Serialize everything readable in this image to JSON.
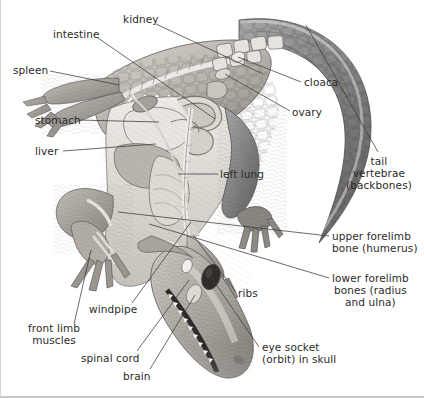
{
  "figure": {
    "background_color": "#ffffff",
    "label_color": "#2b2b2b",
    "leader_color": "#3a3a3a",
    "border_color": "#c9c9c9",
    "width": 424,
    "height": 398
  },
  "labels": [
    {
      "id": "kidney",
      "text": "kidney",
      "x": 122,
      "y": 13,
      "align": "left",
      "leader": [
        [
          155,
          24
        ],
        [
          262,
          74
        ]
      ]
    },
    {
      "id": "intestine",
      "text": "intestine",
      "x": 52,
      "y": 28,
      "align": "left",
      "leader": [
        [
          97,
          38
        ],
        [
          214,
          119
        ]
      ]
    },
    {
      "id": "spleen",
      "text": "spleen",
      "x": 12,
      "y": 64,
      "align": "left",
      "leader": [
        [
          49,
          71
        ],
        [
          118,
          85
        ]
      ]
    },
    {
      "id": "stomach",
      "text": "stomach",
      "x": 34,
      "y": 114,
      "align": "left",
      "leader": [
        [
          77,
          120
        ],
        [
          158,
          122
        ]
      ]
    },
    {
      "id": "liver",
      "text": "liver",
      "x": 34,
      "y": 145,
      "align": "left",
      "leader": [
        [
          62,
          151
        ],
        [
          155,
          144
        ]
      ]
    },
    {
      "id": "cloaca",
      "text": "cloaca",
      "x": 303,
      "y": 76,
      "align": "left",
      "leader": [
        [
          300,
          82
        ],
        [
          237,
          57
        ]
      ]
    },
    {
      "id": "ovary",
      "text": "ovary",
      "x": 291,
      "y": 106,
      "align": "left",
      "leader": [
        [
          289,
          111
        ],
        [
          224,
          74
        ]
      ]
    },
    {
      "id": "tail-vertebrae",
      "text": "tail\nvertebrae\n(backbones)",
      "x": 345,
      "y": 155,
      "align": "center",
      "leader": [
        [
          377,
          152
        ],
        [
          305,
          25
        ]
      ]
    },
    {
      "id": "left-lung",
      "text": "left lung",
      "x": 219,
      "y": 168,
      "align": "left",
      "leader": [
        [
          217,
          174
        ],
        [
          177,
          174
        ]
      ]
    },
    {
      "id": "upper-forelimb",
      "text": "upper forelimb\nbone (humerus)",
      "x": 331,
      "y": 230,
      "align": "left",
      "leader": [
        [
          328,
          236
        ],
        [
          117,
          212
        ]
      ]
    },
    {
      "id": "lower-forelimb",
      "text": "lower forelimb\nbones (radius\nand ulna)",
      "x": 331,
      "y": 272,
      "align": "left",
      "leader": [
        [
          328,
          278
        ],
        [
          148,
          224
        ]
      ]
    },
    {
      "id": "ribs",
      "text": "ribs",
      "x": 237,
      "y": 287,
      "align": "left",
      "leader": [
        [
          235,
          292
        ],
        [
          192,
          235
        ]
      ]
    },
    {
      "id": "windpipe",
      "text": "windpipe",
      "x": 88,
      "y": 303,
      "align": "left",
      "leader": [
        [
          131,
          303
        ],
        [
          190,
          222
        ]
      ]
    },
    {
      "id": "front-limb",
      "text": "front limb\nmuscles",
      "x": 27,
      "y": 322,
      "align": "left",
      "leader": [
        [
          73,
          324
        ],
        [
          90,
          250
        ]
      ]
    },
    {
      "id": "spinal-cord",
      "text": "spinal cord",
      "x": 80,
      "y": 352,
      "align": "left",
      "leader": [
        [
          136,
          351
        ],
        [
          188,
          280
        ]
      ]
    },
    {
      "id": "brain",
      "text": "brain",
      "x": 122,
      "y": 370,
      "align": "left",
      "leader": [
        [
          149,
          369
        ],
        [
          194,
          295
        ]
      ]
    },
    {
      "id": "eye-socket",
      "text": "eye socket\n(orbit) in skull",
      "x": 261,
      "y": 341,
      "align": "left",
      "leader": [
        [
          258,
          347
        ],
        [
          210,
          277
        ]
      ]
    }
  ]
}
